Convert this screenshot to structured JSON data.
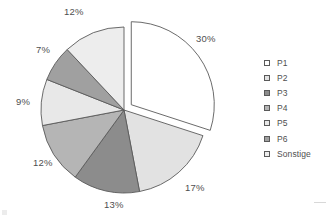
{
  "chart_data": {
    "type": "pie",
    "title": "",
    "labels": [
      "P1",
      "P2",
      "P3",
      "P4",
      "P5",
      "P6",
      "Sonstige"
    ],
    "values": [
      30,
      17,
      13,
      12,
      9,
      7,
      12
    ],
    "value_labels": [
      "30%",
      "17%",
      "13%",
      "12%",
      "9%",
      "7%",
      "12%"
    ],
    "unit": "%",
    "colors": [
      "#ffffff",
      "#e2e2e2",
      "#8c8c8c",
      "#b5b5b5",
      "#e8e8e8",
      "#a0a0a0",
      "#ededed"
    ],
    "start_angle": 0,
    "direction": "clockwise",
    "exploded": [
      "P1"
    ],
    "legend_position": "right",
    "grid": false,
    "outline_color": "#5a5a5a"
  },
  "legend": {
    "items": [
      {
        "label": "P1",
        "color": "#ffffff"
      },
      {
        "label": "P2",
        "color": "#e2e2e2"
      },
      {
        "label": "P3",
        "color": "#8c8c8c"
      },
      {
        "label": "P4",
        "color": "#b5b5b5"
      },
      {
        "label": "P5",
        "color": "#e8e8e8"
      },
      {
        "label": "P6",
        "color": "#a0a0a0"
      },
      {
        "label": "Sonstige",
        "color": "#ededed"
      }
    ]
  },
  "slice_labels": [
    {
      "text": "30%",
      "x": 196,
      "y": 33
    },
    {
      "text": "17%",
      "x": 185,
      "y": 182
    },
    {
      "text": "13%",
      "x": 104,
      "y": 199
    },
    {
      "text": "12%",
      "x": 33,
      "y": 157
    },
    {
      "text": "9%",
      "x": 16,
      "y": 96
    },
    {
      "text": "7%",
      "x": 36,
      "y": 44
    },
    {
      "text": "12%",
      "x": 64,
      "y": 6
    }
  ]
}
